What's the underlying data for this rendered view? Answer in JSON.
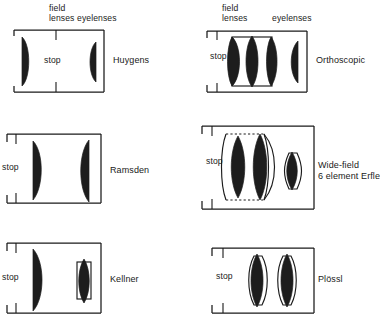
{
  "columns": [
    {
      "id": "left",
      "headers": {
        "field": "field\nlenses",
        "eye": "eyelenses"
      }
    },
    {
      "id": "right",
      "headers": {
        "field": "field\nlenses",
        "eye": "eyelenses"
      }
    }
  ],
  "panels": [
    {
      "id": "huygens",
      "name": "Huygens",
      "stop_label": "stop",
      "stop_position": "center",
      "element_count": 2,
      "elements": [
        "plano-convex field lens",
        "plano-convex eyelens"
      ]
    },
    {
      "id": "orthoscopic",
      "name": "Orthoscopic",
      "stop_label": "stop",
      "stop_position": "left",
      "element_count": 4,
      "elements": [
        "cemented triplet field group",
        "plano-convex eyelens"
      ]
    },
    {
      "id": "ramsden",
      "name": "Ramsden",
      "stop_label": "stop",
      "stop_position": "left",
      "element_count": 2,
      "elements": [
        "plano-convex field lens",
        "plano-convex eyelens"
      ]
    },
    {
      "id": "erfle",
      "name": "Wide-field\n6 element Erfle",
      "stop_label": "stop",
      "stop_position": "left",
      "element_count": 6,
      "elements": [
        "meniscus doublet group",
        "cemented doublet group",
        "plano-convex eyelens"
      ]
    },
    {
      "id": "kellner",
      "name": "Kellner",
      "stop_label": "stop",
      "stop_position": "left",
      "element_count": 3,
      "elements": [
        "plano-convex field lens",
        "cemented achromatic doublet eyelens"
      ]
    },
    {
      "id": "plossl",
      "name": "Plössl",
      "stop_label": "stop",
      "stop_position": "left",
      "element_count": 4,
      "elements": [
        "symmetric doublet",
        "symmetric doublet"
      ]
    }
  ],
  "colors": {
    "glass": "#1d1d1d",
    "line": "#1b1b1b",
    "text": "#1a1a1a",
    "background": "#ffffff"
  }
}
